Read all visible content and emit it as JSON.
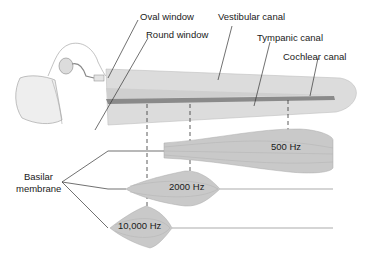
{
  "labels": {
    "oval_window": "Oval window",
    "round_window": "Round window",
    "vestibular_canal": "Vestibular canal",
    "tympanic_canal": "Tympanic canal",
    "cochlear_canal": "Cochlear canal",
    "basilar_line1": "Basilar",
    "basilar_line2": "membrane"
  },
  "frequencies": [
    {
      "label": "500 Hz"
    },
    {
      "label": "2000 Hz"
    },
    {
      "label": "10,000 Hz"
    }
  ],
  "colors": {
    "canal_fill": "#d9d9d9",
    "membrane_fill": "#c8c8c8",
    "cochlear_duct": "#8a8a8a",
    "line": "#333333"
  }
}
